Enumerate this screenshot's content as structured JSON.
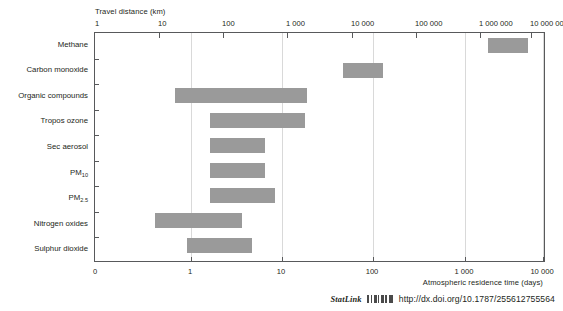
{
  "chart_data": {
    "type": "bar",
    "title": "",
    "subtitle": "",
    "orientation": "horizontal",
    "bar_style": "range",
    "xlabel": "Atmospheric residence time (days)",
    "xlabel_top": "Travel distance (km)",
    "ylabel": "",
    "xscale": "log",
    "xlim": [
      0.5,
      20000
    ],
    "grid": "vertical",
    "legend": "none",
    "bar_color": "#9a9a9a",
    "categories": [
      "Methane",
      "Carbon monoxide",
      "Organic compounds",
      "Tropos ozone",
      "Sec aerosol",
      "PM10",
      "PM2.5",
      "Nitrogen oxides",
      "Sulphur dioxide"
    ],
    "category_labels_html": [
      "Methane",
      "Carbon monoxide",
      "Organic compounds",
      "Tropos ozone",
      "Sec aerosol",
      "PM<sub>10</sub>",
      "PM<sub>2.5</sub>",
      "Nitrogen oxides",
      "Sulphur dioxide"
    ],
    "residence_time_days": [
      {
        "category": "Methane",
        "low": 1500,
        "high": 7000
      },
      {
        "category": "Carbon monoxide",
        "low": 60,
        "high": 160
      },
      {
        "category": "Organic compounds",
        "low": 0.6,
        "high": 14
      },
      {
        "category": "Tropos ozone",
        "low": 2,
        "high": 22
      },
      {
        "category": "Sec aerosol",
        "low": 2,
        "high": 8
      },
      {
        "category": "PM10",
        "low": 2,
        "high": 8
      },
      {
        "category": "PM2.5",
        "low": 2,
        "high": 10
      },
      {
        "category": "Nitrogen oxides",
        "low": 0.6,
        "high": 4
      },
      {
        "category": "Sulphur dioxide",
        "low": 1,
        "high": 5
      }
    ],
    "xticks_bottom": [
      "0",
      "1",
      "10",
      "100",
      "1 000",
      "10 000"
    ],
    "xticks_top": [
      "1",
      "10",
      "100",
      "1 000",
      "10 000",
      "100 000",
      "1 000 000",
      "10 000 000"
    ]
  },
  "axes": {
    "top_title": "Travel distance (km)",
    "bottom_title": "Atmospheric residence time (days)",
    "top_ticks": [
      {
        "label": "1",
        "x": 95
      },
      {
        "label": "10",
        "x": 158
      },
      {
        "label": "100",
        "x": 222
      },
      {
        "label": "1 000",
        "x": 286
      },
      {
        "label": "10 000",
        "x": 351
      },
      {
        "label": "100 000",
        "x": 415
      },
      {
        "label": "1 000 000",
        "x": 479
      },
      {
        "label": "10 000 000",
        "x": 530
      }
    ],
    "bottom_ticks": [
      {
        "label": "0",
        "x": 95
      },
      {
        "label": "1",
        "x": 190
      },
      {
        "label": "10",
        "x": 281
      },
      {
        "label": "100",
        "x": 372
      },
      {
        "label": "1 000",
        "x": 464
      },
      {
        "label": "10 000",
        "x": 542
      }
    ]
  },
  "bars": [
    {
      "name": "Methane",
      "left": 393,
      "width": 40,
      "top": 5
    },
    {
      "name": "Carbon monoxide",
      "left": 248,
      "width": 40,
      "top": 30
    },
    {
      "name": "Organic compounds",
      "left": 80,
      "width": 132,
      "top": 55
    },
    {
      "name": "Tropos ozone",
      "left": 115,
      "width": 95,
      "top": 80
    },
    {
      "name": "Sec aerosol",
      "left": 115,
      "width": 55,
      "top": 105
    },
    {
      "name": "PM10",
      "left": 115,
      "width": 55,
      "top": 130
    },
    {
      "name": "PM2.5",
      "left": 115,
      "width": 65,
      "top": 155
    },
    {
      "name": "Nitrogen oxides",
      "left": 60,
      "width": 87,
      "top": 180
    },
    {
      "name": "Sulphur dioxide",
      "left": 92,
      "width": 65,
      "top": 205
    }
  ],
  "footer": {
    "wordmark": "StatLink",
    "url": "http://dx.doi.org/10.1787/255612755564",
    "barcode_icon": "barcode-icon"
  }
}
